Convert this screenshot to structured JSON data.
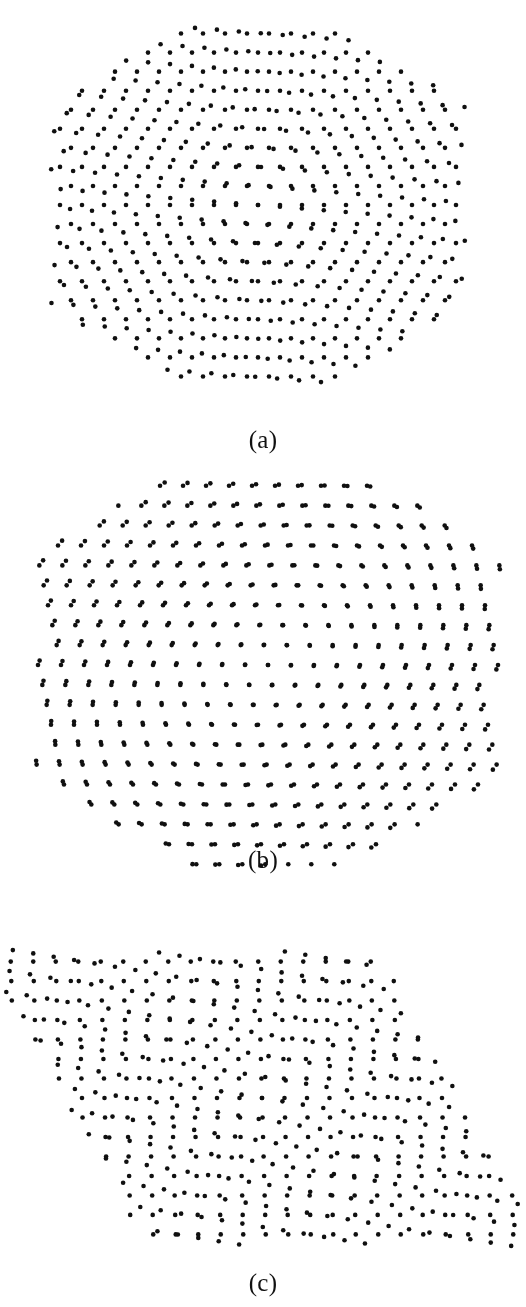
{
  "figure": {
    "width": 526,
    "height": 1307,
    "background_color": "#ffffff",
    "dot_color": "#101010",
    "dot_radius_px": 2.3
  },
  "panels": [
    {
      "id": "a",
      "caption": "(a)",
      "caption_top": 425,
      "region": {
        "top": 0,
        "height": 470
      },
      "description": "Small twist angle: hexagonal moire superlattice of bright spots",
      "lattice": {
        "type": "triangular",
        "spacing_px": 22.0,
        "rotation_deg_layer1": 0.0,
        "rotation_deg_layer2": 4.6,
        "center_x": 258,
        "center_y": 205,
        "mask": {
          "shape": "hexagon",
          "radius_px": 208,
          "orientation_deg": 0
        }
      }
    },
    {
      "id": "b",
      "caption": "(b)",
      "caption_top": 845,
      "region": {
        "top": 470,
        "height": 420
      },
      "description": "Near-commensurate stripe moire: dot pairs align along steep diagonal lines",
      "lattice": {
        "type": "triangular",
        "spacing_px": 23.0,
        "rotation_deg_layer1": 0.0,
        "rotation_deg_layer2": 1.1,
        "shear_x": 0.36,
        "center_x": 268,
        "center_y": 195,
        "mask": {
          "shape": "hexagon",
          "radius_px": 232,
          "orientation_deg": 0
        }
      }
    },
    {
      "id": "c",
      "caption": "(c)",
      "caption_top": 1268,
      "region": {
        "top": 890,
        "height": 417
      },
      "description": "Larger twist angle: rhombic moire cell, pattern sheared to upper right",
      "lattice": {
        "type": "triangular",
        "spacing_px": 22.5,
        "rotation_deg_layer1": 0.0,
        "rotation_deg_layer2": 8.5,
        "shear_x": 0.55,
        "center_x": 262,
        "center_y": 208,
        "mask": {
          "shape": "rhombus",
          "radius_px": 238,
          "orientation_deg": 0
        }
      }
    }
  ]
}
